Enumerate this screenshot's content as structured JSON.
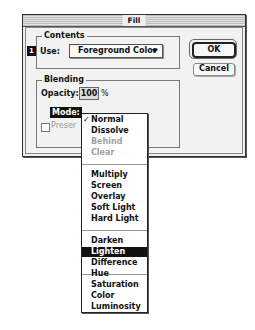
{
  "window": {
    "title": "Fill"
  },
  "buttons": {
    "ok": "OK",
    "cancel": "Cancel"
  },
  "contents": {
    "group_label": "Contents",
    "badge": "1",
    "use_label": "Use:",
    "use_value": "Foreground Color"
  },
  "blending": {
    "group_label": "Blending",
    "opacity_label": "Opacity:",
    "opacity_value": "100",
    "opacity_unit": "%",
    "mode_label": "Mode:",
    "preserve_label": "Preserve Transparency",
    "preserve_visible": "Preser"
  },
  "mode_menu": {
    "check_glyph": "✓",
    "items": [
      {
        "label": "Normal",
        "state": "checked"
      },
      {
        "label": "Dissolve",
        "state": "enabled"
      },
      {
        "label": "Behind",
        "state": "disabled"
      },
      {
        "label": "Clear",
        "state": "disabled"
      },
      {
        "label": "Multiply",
        "state": "enabled"
      },
      {
        "label": "Screen",
        "state": "enabled"
      },
      {
        "label": "Overlay",
        "state": "enabled"
      },
      {
        "label": "Soft Light",
        "state": "enabled"
      },
      {
        "label": "Hard Light",
        "state": "enabled"
      },
      {
        "label": "Darken",
        "state": "enabled"
      },
      {
        "label": "Lighten",
        "state": "highlighted"
      },
      {
        "label": "Difference",
        "state": "enabled"
      },
      {
        "label": "Hue",
        "state": "enabled"
      },
      {
        "label": "Saturation",
        "state": "enabled"
      },
      {
        "label": "Color",
        "state": "enabled"
      },
      {
        "label": "Luminosity",
        "state": "enabled"
      }
    ]
  }
}
